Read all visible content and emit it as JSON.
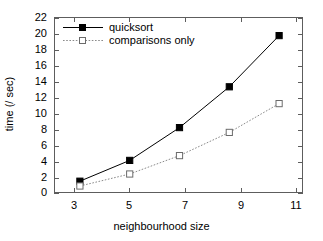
{
  "chart_data": {
    "type": "line",
    "title": "",
    "xlabel": "neighbourhood size",
    "ylabel": "time (/ sec)",
    "x": [
      3,
      5,
      7,
      9,
      11
    ],
    "xlim": [
      2,
      12
    ],
    "ylim": [
      0,
      22
    ],
    "xticks": [
      "3",
      "5",
      "7",
      "9",
      "11"
    ],
    "yticks": [
      "0",
      "2",
      "4",
      "6",
      "8",
      "10",
      "12",
      "14",
      "16",
      "18",
      "20",
      "22"
    ],
    "grid": false,
    "legend_position": "top-left",
    "series": [
      {
        "name": "quicksort",
        "values": [
          1.6,
          4.2,
          8.3,
          13.4,
          19.8
        ],
        "marker": "filled-square",
        "linestyle": "solid",
        "color": "#000000"
      },
      {
        "name": "comparisons only",
        "values": [
          1.0,
          2.5,
          4.8,
          7.7,
          11.3
        ],
        "marker": "open-square",
        "linestyle": "dotted",
        "color": "#808080"
      }
    ]
  },
  "axes": {
    "y_tick_labels": [
      "22",
      "20",
      "18",
      "16",
      "14",
      "12",
      "10",
      "8",
      "6",
      "4",
      "2",
      "0"
    ],
    "x_tick_labels": [
      "3",
      "5",
      "7",
      "9",
      "11"
    ],
    "x_title": "neighbourhood size",
    "y_title": "time (/ sec)"
  },
  "legend": {
    "entries": [
      {
        "label": "quicksort"
      },
      {
        "label": "comparisons only"
      }
    ]
  },
  "colors": {
    "frame": "#5d5d5d",
    "series1": "#000000",
    "series2": "#8a8a8a",
    "background": "#ffffff"
  }
}
